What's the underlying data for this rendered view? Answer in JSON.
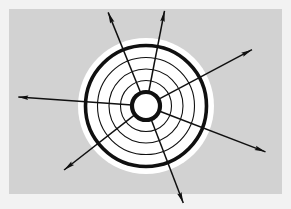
{
  "figure": {
    "title": "Concentric rings with radiating outward arrows",
    "canvas": {
      "width": 291,
      "height": 209,
      "frame_color": "#f2f2f2",
      "panel_color": "#d2d2d2",
      "panel": {
        "x": 9,
        "y": 9,
        "width": 273,
        "height": 185
      }
    },
    "center": {
      "x": 146,
      "y": 106
    },
    "colors": {
      "stroke": "#101010",
      "halo": "#ffffff",
      "hub_fill": "#ffffff",
      "background": "#d2d2d2",
      "frame": "#f2f2f2"
    },
    "halo": {
      "name": "white-halo",
      "radius": 68,
      "color": "#ffffff"
    },
    "rings": [
      {
        "name": "outer-thick-ring",
        "radius": 60.5,
        "stroke_width": 3.6,
        "style": "thick"
      },
      {
        "name": "ring-3",
        "radius": 48.5,
        "stroke_width": 1.1,
        "style": "thin"
      },
      {
        "name": "ring-2",
        "radius": 37.0,
        "stroke_width": 1.1,
        "style": "thin"
      },
      {
        "name": "ring-1",
        "radius": 25.5,
        "stroke_width": 1.1,
        "style": "thin"
      },
      {
        "name": "hub-thick-ring",
        "radius": 14.0,
        "stroke_width": 4.2,
        "style": "thick"
      }
    ],
    "ring_count": 5,
    "arrow_count": 7,
    "arrows": [
      {
        "name": "arrow-west",
        "angle_deg": 176,
        "start_radius": 14,
        "end_radius": 128,
        "head_length": 10,
        "head_width": 4.4
      },
      {
        "name": "arrow-northwest",
        "angle_deg": 112,
        "start_radius": 14,
        "end_radius": 101,
        "head_length": 11,
        "head_width": 4.6
      },
      {
        "name": "arrow-north-northeast",
        "angle_deg": 79,
        "start_radius": 14,
        "end_radius": 97,
        "head_length": 11,
        "head_width": 4.6
      },
      {
        "name": "arrow-east-northeast",
        "angle_deg": 28,
        "start_radius": 14,
        "end_radius": 120,
        "head_length": 11,
        "head_width": 4.6
      },
      {
        "name": "arrow-east-southeast",
        "angle_deg": -21,
        "start_radius": 14,
        "end_radius": 128,
        "head_length": 11,
        "head_width": 4.6
      },
      {
        "name": "arrow-south-southeast",
        "angle_deg": -69,
        "start_radius": 14,
        "end_radius": 104,
        "head_length": 11,
        "head_width": 4.6
      },
      {
        "name": "arrow-southwest",
        "angle_deg": -142,
        "start_radius": 14,
        "end_radius": 104,
        "head_length": 11,
        "head_width": 4.6
      }
    ]
  }
}
